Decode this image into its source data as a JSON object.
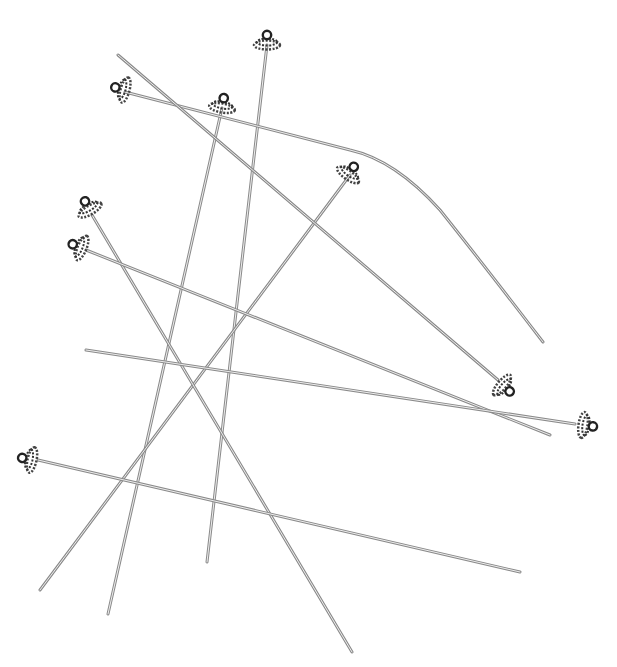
{
  "image": {
    "subject": "Decorative head pins with beaded ends",
    "background_color": "#ffffff",
    "pin_color": "#9a9a9a",
    "pin_highlight": "#e8e8e8",
    "bead_color": "#3a3a3a"
  },
  "pins": [
    {
      "id": "pin-1",
      "head": [
        267,
        40
      ],
      "tail": [
        207,
        562
      ]
    },
    {
      "id": "pin-2",
      "head": [
        222,
        103
      ],
      "tail": [
        108,
        614
      ]
    },
    {
      "id": "pin-3",
      "head": [
        125,
        90
      ],
      "tail": [
        543,
        342
      ],
      "curved": true
    },
    {
      "id": "pin-4",
      "head": [
        352,
        170
      ],
      "tail": [
        40,
        590
      ]
    },
    {
      "id": "pin-5",
      "head": [
        90,
        210
      ],
      "tail": [
        352,
        652
      ]
    },
    {
      "id": "pin-6",
      "head": [
        82,
        245
      ],
      "tail": [
        550,
        435
      ]
    },
    {
      "id": "pin-7",
      "head": [
        502,
        385
      ],
      "tail": [
        118,
        55
      ]
    },
    {
      "id": "pin-8",
      "head": [
        583,
        425
      ],
      "tail": [
        86,
        350
      ]
    },
    {
      "id": "pin-9",
      "head": [
        30,
        458
      ],
      "tail": [
        520,
        572
      ]
    }
  ]
}
